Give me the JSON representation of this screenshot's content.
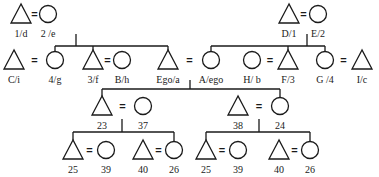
{
  "diagram": {
    "type": "kinship-chart",
    "stroke_color": "#1a1a1a",
    "background": "#ffffff",
    "nodes": [
      {
        "id": "1d",
        "label": "1/d",
        "sex": "male",
        "x": 21,
        "y": 14
      },
      {
        "id": "2e",
        "label": "2 /e",
        "sex": "female",
        "x": 48,
        "y": 14
      },
      {
        "id": "D1",
        "label": "D/1",
        "sex": "male",
        "x": 289,
        "y": 14
      },
      {
        "id": "E2",
        "label": "E/2",
        "sex": "female",
        "x": 318,
        "y": 14
      },
      {
        "id": "Ci",
        "label": "C/i",
        "sex": "male",
        "x": 14,
        "y": 60
      },
      {
        "id": "4g",
        "label": "4/g",
        "sex": "female",
        "x": 55,
        "y": 60
      },
      {
        "id": "3f",
        "label": "3/f",
        "sex": "male",
        "x": 93,
        "y": 60
      },
      {
        "id": "Bh",
        "label": "B/h",
        "sex": "female",
        "x": 122,
        "y": 60
      },
      {
        "id": "Egoa",
        "label": "Ego/a",
        "sex": "male",
        "x": 168,
        "y": 60
      },
      {
        "id": "Aego",
        "label": "A/ego",
        "sex": "female",
        "x": 211,
        "y": 60
      },
      {
        "id": "Hb",
        "label": "H/ b",
        "sex": "female",
        "x": 252,
        "y": 60
      },
      {
        "id": "F3",
        "label": "F/3",
        "sex": "male",
        "x": 288,
        "y": 60
      },
      {
        "id": "G4",
        "label": "G /4",
        "sex": "female",
        "x": 325,
        "y": 60
      },
      {
        "id": "Ic",
        "label": "I/c",
        "sex": "male",
        "x": 362,
        "y": 60
      },
      {
        "id": "23",
        "label": "23",
        "sex": "male",
        "x": 102,
        "y": 106
      },
      {
        "id": "37",
        "label": "37",
        "sex": "female",
        "x": 143,
        "y": 106
      },
      {
        "id": "38",
        "label": "38",
        "sex": "male",
        "x": 238,
        "y": 106
      },
      {
        "id": "24",
        "label": "24",
        "sex": "female",
        "x": 280,
        "y": 106
      },
      {
        "id": "25a",
        "label": "25",
        "sex": "male",
        "x": 73,
        "y": 150
      },
      {
        "id": "39a",
        "label": "39",
        "sex": "female",
        "x": 106,
        "y": 150
      },
      {
        "id": "40a",
        "label": "40",
        "sex": "male",
        "x": 143,
        "y": 150
      },
      {
        "id": "26a",
        "label": "26",
        "sex": "female",
        "x": 174,
        "y": 150
      },
      {
        "id": "25b",
        "label": "25",
        "sex": "male",
        "x": 206,
        "y": 150
      },
      {
        "id": "39b",
        "label": "39",
        "sex": "female",
        "x": 238,
        "y": 150
      },
      {
        "id": "40b",
        "label": "40",
        "sex": "male",
        "x": 279,
        "y": 150
      },
      {
        "id": "26b",
        "label": "26",
        "sex": "female",
        "x": 310,
        "y": 150
      }
    ],
    "marriages": [
      [
        "1d",
        "2e"
      ],
      [
        "D1",
        "E2"
      ],
      [
        "Ci",
        "4g"
      ],
      [
        "3f",
        "Bh"
      ],
      [
        "Egoa",
        "Aego"
      ],
      [
        "Hb",
        "F3"
      ],
      [
        "G4",
        "Ic"
      ],
      [
        "23",
        "37"
      ],
      [
        "38",
        "24"
      ],
      [
        "25a",
        "39a"
      ],
      [
        "40a",
        "26a"
      ],
      [
        "25b",
        "39b"
      ],
      [
        "40b",
        "26b"
      ]
    ],
    "marriage_symbol": "="
  }
}
